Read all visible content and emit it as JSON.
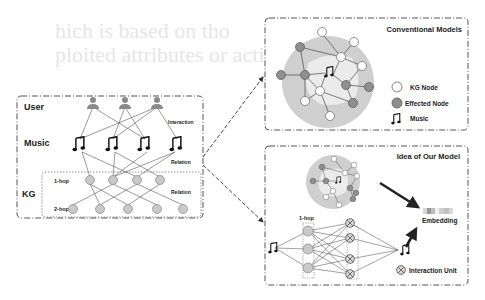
{
  "background_ghost_text": {
    "line1": "hich is based on tho",
    "line2": "ploited attributes or acti"
  },
  "left_panel": {
    "labels": {
      "user": "User",
      "music": "Music",
      "kg": "KG",
      "hop1": "1-hop",
      "hop2": "2-hop",
      "interaction": "Interaction",
      "relation_upper": "Relation",
      "relation_lower": "Relation"
    },
    "counts": {
      "users": 3,
      "music": 4,
      "hop1_nodes": 4,
      "hop2_nodes": 5
    }
  },
  "conventional_panel": {
    "title": "Conventional Models",
    "legend": [
      {
        "icon": "white-circle-icon",
        "label": "KG Node"
      },
      {
        "icon": "gray-circle-icon",
        "label": "Effected Node"
      },
      {
        "icon": "music-note-icon",
        "label": "Music"
      }
    ]
  },
  "our_model_panel": {
    "title": "Idea of Our Model",
    "hop_label": "1-hop",
    "embedding_label": "Embedding",
    "interaction_unit_label": "Interaction Unit",
    "embedding_cells": [
      "#d5d5d5",
      "#9a9a9a",
      "#bcbcbc",
      "#f0f0f0",
      "#cfcfcf",
      "#c0c0c0",
      "#d8d8d8"
    ]
  },
  "colors": {
    "node_gray": "#bdbdbd",
    "effected_node": "#8f8f8f",
    "outer_circle": "#cfcfcf",
    "inner_region": "#e8e8e8",
    "user_icon": "#8a8a8a",
    "line": "#333333"
  }
}
